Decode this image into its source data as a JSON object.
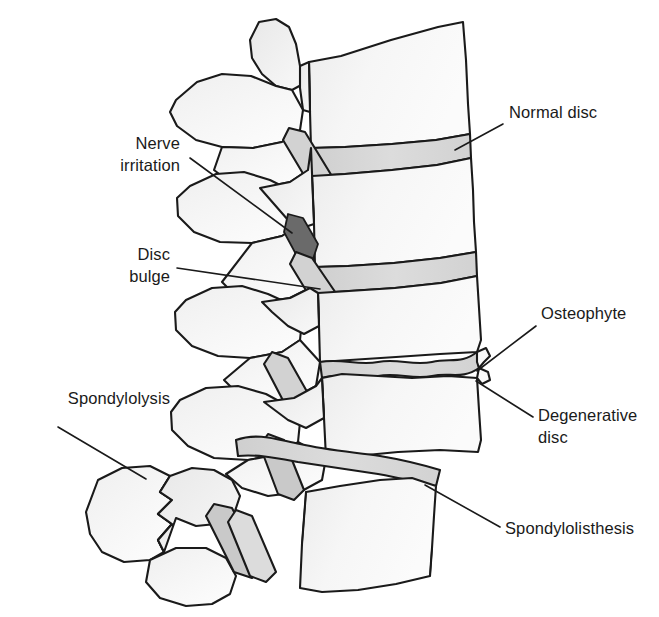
{
  "figure": {
    "view": "lateral"
  },
  "colors": {
    "outline": "#1a1a1a",
    "bone_fill": "#f2f2f2",
    "bone_shade": "#e3e3e3",
    "disc_normal": "#d6d6d6",
    "disc_degenerative": "#cccccc",
    "nerve_compression": "#6a6a6a",
    "label_text": "#1a1a1a",
    "background": "#ffffff",
    "leader_line": "#1a1a1a"
  },
  "callouts": [
    {
      "id": "normal-disc",
      "label": "Normal disc",
      "side": "right",
      "lines": 1,
      "text_x": 509,
      "text_y": 110,
      "leader": {
        "x1": 503,
        "y1": 124,
        "x2": 455,
        "y2": 150
      }
    },
    {
      "id": "nerve-irritation",
      "label": "Nerve\nirritation",
      "side": "left",
      "lines": 2,
      "text_x": 80,
      "text_y": 141,
      "text_width": 100,
      "leader": {
        "x1": 190,
        "y1": 158,
        "x2": 290,
        "y2": 232
      }
    },
    {
      "id": "disc-bulge",
      "label": "Disc\nbulge",
      "side": "left",
      "lines": 2,
      "text_x": 80,
      "text_y": 252,
      "text_width": 90,
      "leader": {
        "x1": 177,
        "y1": 268,
        "x2": 318,
        "y2": 288
      }
    },
    {
      "id": "osteophyte",
      "label": "Osteophyte",
      "side": "right",
      "lines": 1,
      "text_x": 541,
      "text_y": 311,
      "leader": {
        "x1": 536,
        "y1": 326,
        "x2": 475,
        "y2": 372
      }
    },
    {
      "id": "degenerative-disc",
      "label": "Degenerative\ndisc",
      "side": "right",
      "lines": 2,
      "text_x": 538,
      "text_y": 413,
      "leader": {
        "x1": 533,
        "y1": 418,
        "x2": 474,
        "y2": 382
      }
    },
    {
      "id": "spondylolysis",
      "label": "Spondylolysis",
      "side": "left",
      "lines": 1,
      "text_x": 14,
      "text_y": 396,
      "leader": {
        "x1": 58,
        "y1": 427,
        "x2": 144,
        "y2": 478
      }
    },
    {
      "id": "spondylolisthesis",
      "label": "Spondylolisthesis",
      "side": "right",
      "lines": 1,
      "text_x": 505,
      "text_y": 526,
      "leader": {
        "x1": 500,
        "y1": 528,
        "x2": 424,
        "y2": 485
      }
    }
  ],
  "anatomy": {
    "levels": [
      {
        "id": "vertebra-1",
        "name": "upper vertebral body"
      },
      {
        "id": "vertebra-2",
        "name": "second vertebral body"
      },
      {
        "id": "vertebra-3",
        "name": "third vertebral body"
      },
      {
        "id": "vertebra-4",
        "name": "fourth vertebral body"
      },
      {
        "id": "vertebra-5",
        "name": "slipped vertebral body"
      }
    ],
    "discs": [
      {
        "id": "disc-normal",
        "state": "normal"
      },
      {
        "id": "disc-bulging",
        "state": "bulging"
      },
      {
        "id": "disc-degenerative",
        "state": "degenerative"
      },
      {
        "id": "disc-slipped",
        "state": "degenerative with slip"
      }
    ],
    "features": [
      {
        "id": "spinous-process",
        "name": "spinous process"
      },
      {
        "id": "facet-joint",
        "name": "facet joint"
      },
      {
        "id": "pars-fracture",
        "name": "pars interarticularis defect"
      },
      {
        "id": "osteophyte-spur",
        "name": "osteophyte spur"
      },
      {
        "id": "nerve-root",
        "name": "compressed nerve root"
      }
    ]
  }
}
